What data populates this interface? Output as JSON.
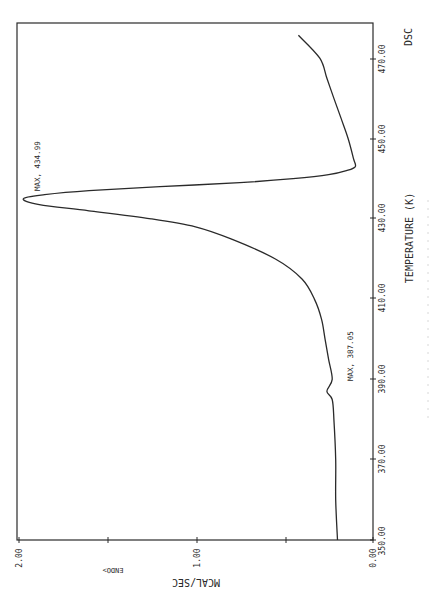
{
  "chart_data": {
    "type": "line",
    "title": "DSC",
    "orientation": "rotated 90° counter-clockwise (temperature axis vertical on right, heat-flow axis horizontal on bottom)",
    "xlabel": "TEMPERATURE (K)",
    "ylabel": "MCAL/SEC",
    "direction_label": "ENDO>",
    "x_axis": {
      "range": [
        350,
        475.7
      ],
      "ticks": [
        350,
        370,
        390,
        410,
        430,
        450,
        470
      ],
      "tick_labels": [
        "350.00",
        "370.00",
        "390.00",
        "410.00",
        "430.00",
        "450.00",
        "470.00"
      ]
    },
    "y_axis": {
      "range": [
        0,
        2
      ],
      "ticks": [
        0,
        0.5,
        1,
        1.5,
        2
      ],
      "tick_labels": [
        "0.00",
        "",
        "1.00",
        "",
        "2.00"
      ]
    },
    "grid": false,
    "series": [
      {
        "name": "DSC heat flow",
        "x": [
          350,
          360,
          370,
          380,
          385,
          387.05,
          390,
          395,
          400,
          405,
          410,
          415,
          420,
          425,
          428,
          430,
          432,
          433.5,
          434.99,
          436,
          437,
          438,
          439,
          440,
          441,
          442,
          443,
          445,
          450,
          455,
          460,
          465,
          470,
          475.7
        ],
        "values": [
          0.2,
          0.21,
          0.21,
          0.22,
          0.23,
          0.26,
          0.23,
          0.25,
          0.27,
          0.29,
          0.33,
          0.4,
          0.55,
          0.8,
          1.0,
          1.25,
          1.6,
          1.88,
          1.97,
          1.85,
          1.6,
          1.2,
          0.75,
          0.45,
          0.25,
          0.15,
          0.1,
          0.11,
          0.14,
          0.18,
          0.22,
          0.26,
          0.3,
          0.42
        ]
      }
    ],
    "annotations": [
      {
        "text": "MAX, 434.99",
        "x": 434.99,
        "y": 1.97
      },
      {
        "text": "MAX, 387.05",
        "x": 387.05,
        "y": 0.26
      }
    ]
  },
  "labels": {
    "title": "DSC",
    "xlabel": "TEMPERATURE (K)",
    "ylabel": "MCAL/SEC",
    "endo": "ENDO>",
    "peak1": "MAX, 434.99",
    "peak2": "MAX, 387.05",
    "ytick_0": "0.00",
    "ytick_1": "1.00",
    "ytick_2": "2.00",
    "xtick_350": "350.00",
    "xtick_370": "370.00",
    "xtick_390": "390.00",
    "xtick_410": "410.00",
    "xtick_430": "430.00",
    "xtick_450": "450.00",
    "xtick_470": "470.00"
  },
  "colors": {
    "ink": "#2a2a2a",
    "background": "#ffffff"
  }
}
